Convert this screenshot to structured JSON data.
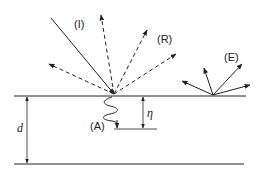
{
  "diagram": {
    "labels": {
      "incident": "(I)",
      "reflected": "(R)",
      "emitted": "(E)",
      "absorbed": "(A)",
      "depth_eta": "η",
      "thickness_d": "d"
    },
    "colors": {
      "line": "#222222",
      "background": "#ffffff"
    }
  }
}
